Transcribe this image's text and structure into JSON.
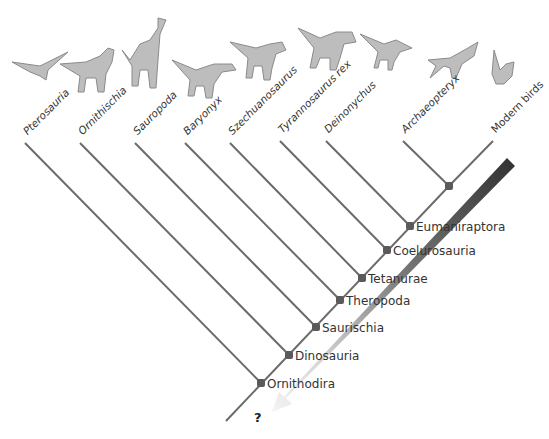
{
  "taxa": [
    {
      "label": "Pterosauria",
      "italic": true,
      "tip": [
        25,
        143
      ],
      "icon": "pterosaur-icon"
    },
    {
      "label": "Ornithischia",
      "italic": true,
      "tip": [
        80,
        143
      ],
      "icon": "hadrosaur-icon"
    },
    {
      "label": "Sauropoda",
      "italic": true,
      "tip": [
        135,
        143
      ],
      "icon": "sauropod-icon"
    },
    {
      "label": "Baryonyx",
      "italic": true,
      "tip": [
        185,
        143
      ],
      "icon": "baryonyx-icon"
    },
    {
      "label": "Szechuanosaurus",
      "italic": true,
      "tip": [
        230,
        143
      ],
      "icon": "szechuanosaurus-icon"
    },
    {
      "label": "Tyrannosaurus rex",
      "italic": true,
      "tip": [
        280,
        141
      ],
      "icon": "tyrannosaurus-icon"
    },
    {
      "label": "Deinonychus",
      "italic": true,
      "tip": [
        326,
        141
      ],
      "icon": "deinonychus-icon"
    },
    {
      "label": "Archaeopteryx",
      "italic": true,
      "tip": [
        403,
        141
      ],
      "icon": "archaeopteryx-icon"
    },
    {
      "label": "Modern birds",
      "italic": false,
      "tip": [
        493,
        141
      ],
      "icon": "bird-icon"
    }
  ],
  "clades": [
    {
      "label": "Eumaniraptora",
      "node": [
        410,
        226
      ]
    },
    {
      "label": "Coelurosauria",
      "node": [
        387,
        250
      ]
    },
    {
      "label": "Tetanurae",
      "node": [
        362,
        278
      ]
    },
    {
      "label": "Theropoda",
      "node": [
        340,
        300
      ]
    },
    {
      "label": "Saurischia",
      "node": [
        316,
        327
      ]
    },
    {
      "label": "Dinosauria",
      "node": [
        289,
        355
      ]
    },
    {
      "label": "Ornithodira",
      "node": [
        261,
        383
      ]
    }
  ],
  "bird_node": [
    449,
    186
  ],
  "root_end": [
    226,
    421
  ],
  "unknown_label": "?",
  "colors": {
    "line": "#6b6b6b",
    "node": "#5a5a5a",
    "arrow_dark": "#333333",
    "arrow_light": "#f2f2f2",
    "animal": "#bdbdbd"
  }
}
